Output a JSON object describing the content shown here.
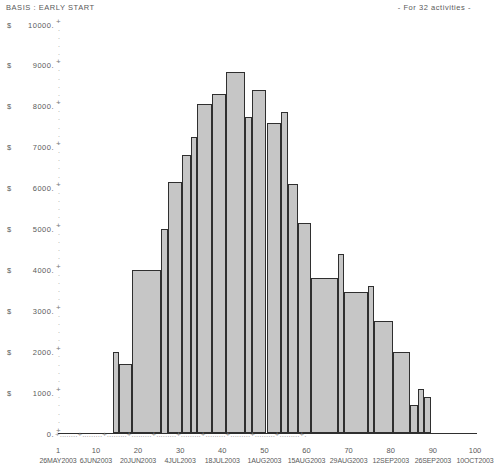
{
  "header": {
    "basis_label": "BASIS : EARLY START",
    "activities_note": "- For 32 activities -"
  },
  "axis": {
    "currency_symbol": "$",
    "y_ticks": [
      "10000.",
      "9000.",
      "8000.",
      "7000.",
      "6000.",
      "5000.",
      "4000.",
      "3000.",
      "2000.",
      "1000.",
      "0."
    ],
    "x_tick_numbers": [
      "1",
      "10",
      "20",
      "30",
      "40",
      "50",
      "60",
      "70",
      "80",
      "90",
      "100"
    ],
    "x_tick_dates": [
      "26MAY2003",
      "6JUN2003",
      "20JUN2003",
      "4JUL2003",
      "18JUL2003",
      "1AUG2003",
      "15AUG2003",
      "29AUG2003",
      "12SEP2003",
      "26SEP2003",
      "10OCT2003"
    ],
    "dot_char": ".",
    "plus_char": "+"
  },
  "colors": {
    "bar_fill": "#c6c6c6",
    "bar_stroke": "#2f2f2f",
    "text": "#5a5a5a",
    "axis": "#9a9a9a",
    "background": "#ffffff"
  },
  "chart_data": {
    "type": "bar",
    "title": "BASIS : EARLY START",
    "subtitle": "- For 32 activities -",
    "xlabel": "",
    "ylabel": "$",
    "ylim": [
      0,
      10000
    ],
    "xlim": [
      1,
      100
    ],
    "grid": false,
    "legend": "none",
    "y_tick_values": [
      0,
      1000,
      2000,
      3000,
      4000,
      5000,
      6000,
      7000,
      8000,
      9000,
      10000
    ],
    "x_tick_values": [
      1,
      10,
      20,
      30,
      40,
      50,
      60,
      70,
      80,
      90,
      100
    ],
    "x_tick_dates": [
      "26MAY2003",
      "6JUN2003",
      "20JUN2003",
      "4JUL2003",
      "18JUL2003",
      "1AUG2003",
      "15AUG2003",
      "29AUG2003",
      "12SEP2003",
      "26SEP2003",
      "10OCT2003"
    ],
    "bars": [
      {
        "x_start": 14.0,
        "x_end": 15.5,
        "value": 2000
      },
      {
        "x_start": 15.5,
        "x_end": 18.5,
        "value": 1700
      },
      {
        "x_start": 18.5,
        "x_end": 25.5,
        "value": 4000
      },
      {
        "x_start": 25.5,
        "x_end": 27.0,
        "value": 5000
      },
      {
        "x_start": 27.0,
        "x_end": 30.5,
        "value": 6150
      },
      {
        "x_start": 30.5,
        "x_end": 32.5,
        "value": 6800
      },
      {
        "x_start": 32.5,
        "x_end": 34.0,
        "value": 7250
      },
      {
        "x_start": 34.0,
        "x_end": 37.5,
        "value": 8050
      },
      {
        "x_start": 37.5,
        "x_end": 41.0,
        "value": 8300
      },
      {
        "x_start": 41.0,
        "x_end": 45.5,
        "value": 8850
      },
      {
        "x_start": 45.5,
        "x_end": 47.0,
        "value": 7750
      },
      {
        "x_start": 47.0,
        "x_end": 50.5,
        "value": 8400
      },
      {
        "x_start": 50.5,
        "x_end": 54.0,
        "value": 7600
      },
      {
        "x_start": 54.0,
        "x_end": 55.5,
        "value": 7850
      },
      {
        "x_start": 55.5,
        "x_end": 58.0,
        "value": 6100
      },
      {
        "x_start": 58.0,
        "x_end": 61.0,
        "value": 5150
      },
      {
        "x_start": 61.0,
        "x_end": 67.5,
        "value": 3800
      },
      {
        "x_start": 67.5,
        "x_end": 69.0,
        "value": 4400
      },
      {
        "x_start": 69.0,
        "x_end": 74.5,
        "value": 3450
      },
      {
        "x_start": 74.5,
        "x_end": 76.0,
        "value": 3600
      },
      {
        "x_start": 76.0,
        "x_end": 80.5,
        "value": 2750
      },
      {
        "x_start": 80.5,
        "x_end": 84.5,
        "value": 2000
      },
      {
        "x_start": 84.5,
        "x_end": 86.5,
        "value": 700
      },
      {
        "x_start": 86.5,
        "x_end": 88.0,
        "value": 1100
      },
      {
        "x_start": 88.0,
        "x_end": 89.5,
        "value": 900
      }
    ]
  }
}
